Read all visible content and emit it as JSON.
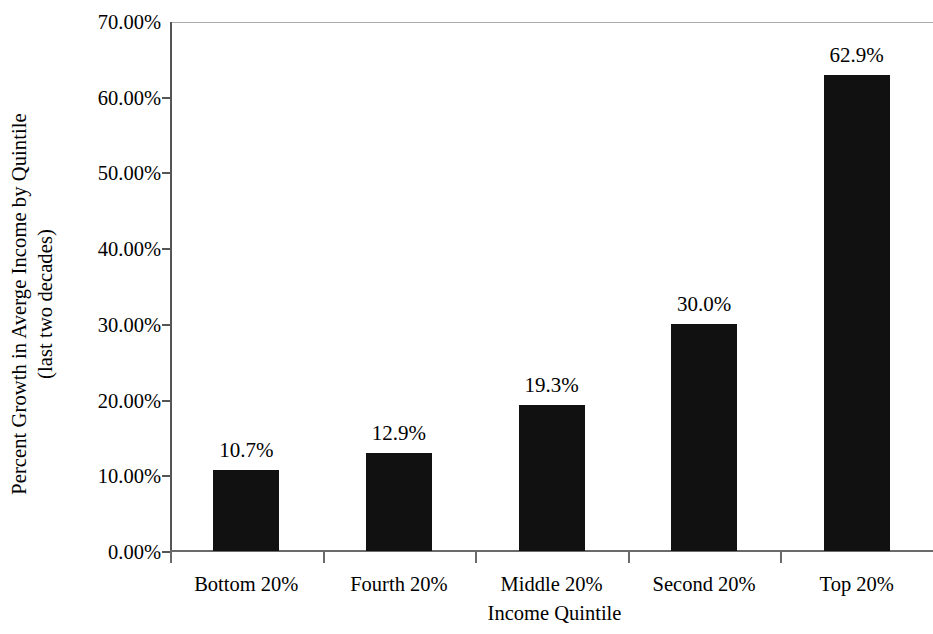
{
  "chart_data": {
    "type": "bar",
    "title": "",
    "xlabel": "Income Quintile",
    "ylabel": "Percent Growth in Averge Income by Quintile (last two decades)",
    "ylabel_line1": "Percent Growth in Averge Income by Quintile",
    "ylabel_line2": "(last two decades)",
    "categories": [
      "Bottom 20%",
      "Fourth 20%",
      "Middle 20%",
      "Second 20%",
      "Top 20%"
    ],
    "values": [
      10.7,
      12.9,
      19.3,
      30.0,
      62.9
    ],
    "data_labels": [
      "10.7%",
      "12.9%",
      "19.3%",
      "30.0%",
      "62.9%"
    ],
    "ylim": [
      0,
      70
    ],
    "ytick_values": [
      0,
      10,
      20,
      30,
      40,
      50,
      60,
      70
    ],
    "ytick_labels": [
      "0.00%",
      "10.00%",
      "20.00%",
      "30.00%",
      "40.00%",
      "50.00%",
      "60.00%",
      "70.00%"
    ],
    "grid": "top-border-only",
    "legend": "none",
    "bar_color": "#111111",
    "axis_color": "#555555",
    "background_color": "#ffffff"
  }
}
